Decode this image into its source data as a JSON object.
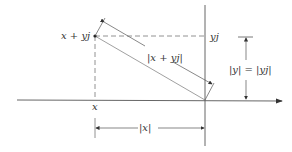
{
  "figure": {
    "labels": {
      "point": "x + yj",
      "imag_projection": "yj",
      "real_projection": "x",
      "magnitude": "|x + yj|",
      "imag_magnitude": "|y| = |yj|",
      "real_magnitude": "|x|"
    },
    "colors": {
      "line": "#555555",
      "dashed": "#777777",
      "text": "#333333",
      "background": "#ffffff"
    }
  }
}
